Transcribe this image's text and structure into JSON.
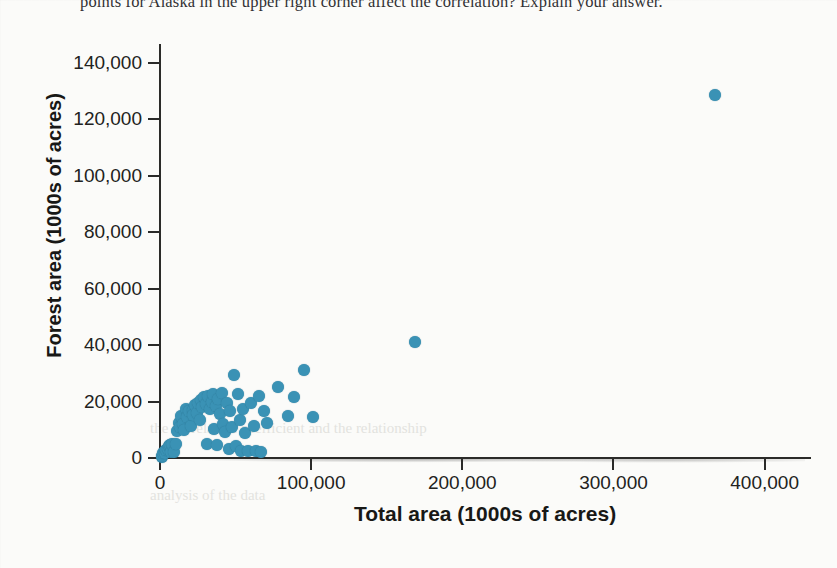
{
  "page": {
    "top_cropped_text": "points for Alaska in the upper right corner affect the correlation? Explain your answer.",
    "ghost_line_1": "the correlation coefficient and the relationship",
    "ghost_line_2": "analysis of the data"
  },
  "chart_data": {
    "type": "scatter",
    "title": "",
    "xlabel": "Total area (1000s of acres)",
    "ylabel": "Forest area (1000s of acres)",
    "xlim": [
      0,
      430000
    ],
    "ylim": [
      0,
      148000
    ],
    "xticks": [
      0,
      100000,
      200000,
      300000,
      400000
    ],
    "xtick_labels": [
      "0",
      "100,000",
      "200,000",
      "300,000",
      "400,000"
    ],
    "yticks": [
      0,
      20000,
      40000,
      60000,
      80000,
      100000,
      120000,
      140000
    ],
    "ytick_labels": [
      "0",
      "20,000",
      "40,000",
      "60,000",
      "80,000",
      "100,000",
      "120,000",
      "140,000"
    ],
    "grid": false,
    "legend": null,
    "marker_color": "#3a92b5",
    "marker_size_px": 12,
    "points": [
      [
        1000,
        400
      ],
      [
        1300,
        800
      ],
      [
        2200,
        1800
      ],
      [
        3100,
        2500
      ],
      [
        3600,
        1900
      ],
      [
        4100,
        2900
      ],
      [
        5200,
        3100
      ],
      [
        5900,
        4200
      ],
      [
        6600,
        4600
      ],
      [
        7000,
        2100
      ],
      [
        8100,
        5100
      ],
      [
        9200,
        2300
      ],
      [
        10500,
        4800
      ],
      [
        11500,
        9500
      ],
      [
        12300,
        12500
      ],
      [
        13000,
        11000
      ],
      [
        14000,
        15000
      ],
      [
        15000,
        12000
      ],
      [
        16200,
        9800
      ],
      [
        17000,
        17300
      ],
      [
        18100,
        14500
      ],
      [
        19000,
        16500
      ],
      [
        20300,
        11400
      ],
      [
        21500,
        17000
      ],
      [
        22000,
        15300
      ],
      [
        23100,
        18800
      ],
      [
        24300,
        16000
      ],
      [
        25400,
        19500
      ],
      [
        26200,
        13500
      ],
      [
        27000,
        20500
      ],
      [
        28100,
        18000
      ],
      [
        29000,
        21500
      ],
      [
        30300,
        19000
      ],
      [
        31200,
        5100
      ],
      [
        32000,
        22000
      ],
      [
        33100,
        17500
      ],
      [
        34200,
        19800
      ],
      [
        35100,
        22500
      ],
      [
        35900,
        10200
      ],
      [
        36800,
        18500
      ],
      [
        37500,
        4700
      ],
      [
        38600,
        21000
      ],
      [
        39500,
        15500
      ],
      [
        40800,
        23000
      ],
      [
        41600,
        12200
      ],
      [
        43000,
        9300
      ],
      [
        44300,
        19300
      ],
      [
        45500,
        3300
      ],
      [
        46400,
        16800
      ],
      [
        47700,
        11000
      ],
      [
        49000,
        29500
      ],
      [
        50300,
        4200
      ],
      [
        51500,
        22500
      ],
      [
        52600,
        13600
      ],
      [
        53800,
        2600
      ],
      [
        55100,
        17500
      ],
      [
        56300,
        8800
      ],
      [
        58000,
        2400
      ],
      [
        60200,
        19500
      ],
      [
        62100,
        11200
      ],
      [
        63500,
        2600
      ],
      [
        65400,
        22000
      ],
      [
        66800,
        2200
      ],
      [
        68500,
        16800
      ],
      [
        70500,
        12500
      ],
      [
        78200,
        25000
      ],
      [
        84500,
        14800
      ],
      [
        88500,
        21600
      ],
      [
        95000,
        31000
      ],
      [
        101000,
        14500
      ],
      [
        169000,
        41000
      ],
      [
        367000,
        128500
      ]
    ]
  }
}
